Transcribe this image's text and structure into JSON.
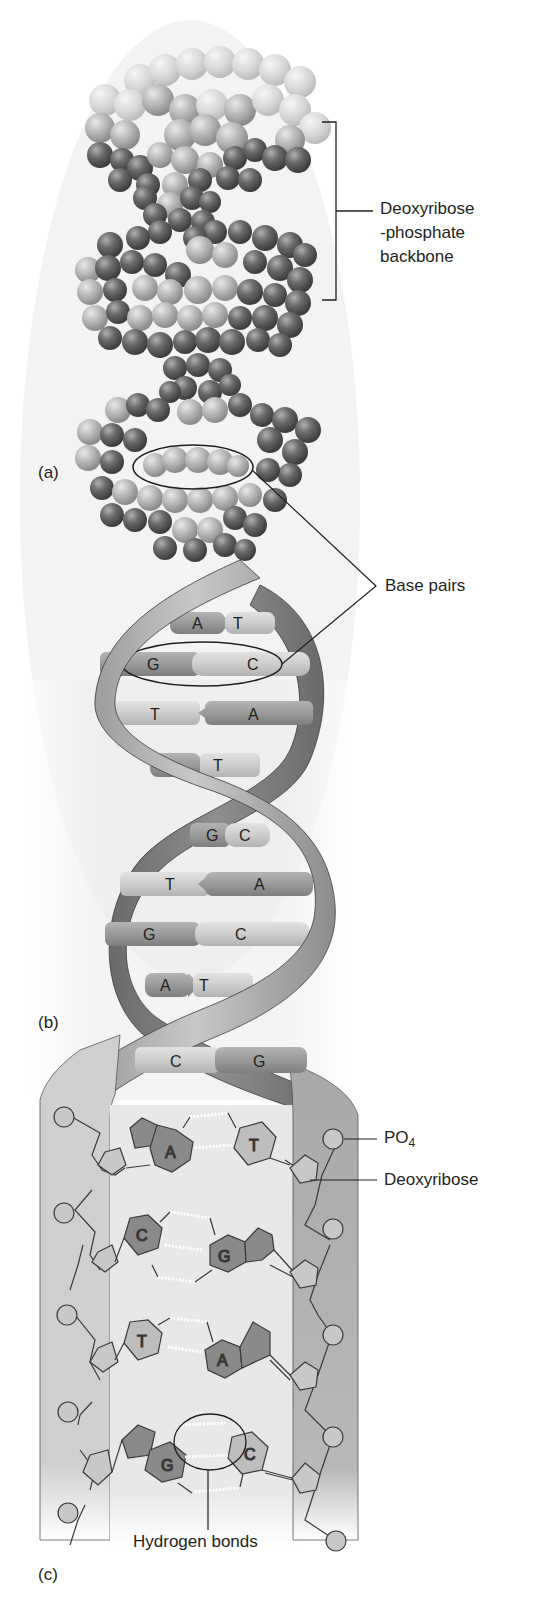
{
  "figure": {
    "panels": [
      {
        "id": "a",
        "label": "(a)",
        "description": "Space-filling model of DNA double helix"
      },
      {
        "id": "b",
        "label": "(b)",
        "description": "Ribbon model of DNA double helix with base pairs"
      },
      {
        "id": "c",
        "label": "(c)",
        "description": "Chemical structure schematic of paired nucleotides"
      }
    ],
    "callouts": {
      "backbone_line1": "Deoxyribose",
      "backbone_line2": "-phosphate",
      "backbone_line3": "backbone",
      "base_pairs": "Base pairs",
      "phosphate": "PO",
      "phosphate_sub": "4",
      "deoxyribose": "Deoxyribose",
      "hydrogen_bonds": "Hydrogen bonds"
    },
    "ribbon_base_pairs": [
      {
        "left": "A",
        "right": "T"
      },
      {
        "left": "G",
        "right": "C"
      },
      {
        "left": "T",
        "right": "A"
      },
      {
        "left": "A",
        "right": "T"
      },
      {
        "left": "G",
        "right": "C"
      },
      {
        "left": "T",
        "right": "A"
      },
      {
        "left": "G",
        "right": "C"
      },
      {
        "left": "A",
        "right": "T"
      },
      {
        "left": "C",
        "right": "G"
      }
    ],
    "chemical_base_pairs": [
      {
        "left": "A",
        "right": "T",
        "hydrogen_bonds": 2
      },
      {
        "left": "C",
        "right": "G",
        "hydrogen_bonds": 3
      },
      {
        "left": "T",
        "right": "A",
        "hydrogen_bonds": 2
      },
      {
        "left": "G",
        "right": "C",
        "hydrogen_bonds": 3
      }
    ],
    "colors": {
      "purine": "#8a8a8a",
      "pyrimidine": "#bdbdbd",
      "backbone_dark": "#6e6e6e",
      "backbone_light": "#a8a8a8",
      "ribbon": "#9a9a9a",
      "background_fade": "#e6e6e6",
      "line": "#231f20"
    }
  }
}
